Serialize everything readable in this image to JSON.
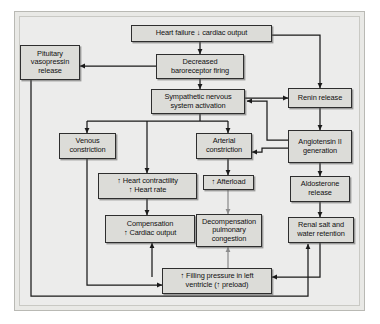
{
  "figure": {
    "background_color": "#ececeb",
    "node_fill_color": "#dcdcd8",
    "node_border_color": "#2e2e2e",
    "arrow_color": "#1a1a1a",
    "arrow_color_muted": "#8c8c8c"
  },
  "nodes": [
    {
      "id": "heart-failure",
      "label": "Heart failure ↓ cardiac output"
    },
    {
      "id": "pituitary",
      "label": "Pituitary\nvasopressin\nrelease"
    },
    {
      "id": "baroreceptor",
      "label": "Decreased\nbaroreceptor firing"
    },
    {
      "id": "sympathetic",
      "label": "Sympathetic nervous\nsystem activation"
    },
    {
      "id": "renin",
      "label": "Renin release"
    },
    {
      "id": "venous-constriction",
      "label": "Venous\nconstriction"
    },
    {
      "id": "arterial-constriction",
      "label": "Arterial\nconstriction"
    },
    {
      "id": "angiotensin",
      "label": "Angiotensin II\ngeneration"
    },
    {
      "id": "contractility",
      "label": "↑ Heart contractility\n↑ Heart rate"
    },
    {
      "id": "afterload",
      "label": "↑ Afterload"
    },
    {
      "id": "aldosterone",
      "label": "Aldosterone\nrelease"
    },
    {
      "id": "compensation",
      "label": "Compensation\n↑ Cardiac output"
    },
    {
      "id": "decompensation",
      "label": "Decompensation\npulmonary\ncongestion"
    },
    {
      "id": "renal-retention",
      "label": "Renal salt and\nwater retention"
    },
    {
      "id": "filling-pressure",
      "label": "↑ Filling pressure in left\nventricle (↑ preload)"
    }
  ],
  "edges": [
    {
      "from": "heart-failure",
      "to": "baroreceptor"
    },
    {
      "from": "heart-failure",
      "to": "renin"
    },
    {
      "from": "baroreceptor",
      "to": "pituitary"
    },
    {
      "from": "baroreceptor",
      "to": "sympathetic"
    },
    {
      "from": "sympathetic",
      "to": "renin"
    },
    {
      "from": "sympathetic",
      "to": "venous-constriction"
    },
    {
      "from": "sympathetic",
      "to": "contractility"
    },
    {
      "from": "sympathetic",
      "to": "arterial-constriction"
    },
    {
      "from": "renin",
      "to": "angiotensin"
    },
    {
      "from": "angiotensin",
      "to": "sympathetic"
    },
    {
      "from": "angiotensin",
      "to": "arterial-constriction"
    },
    {
      "from": "angiotensin",
      "to": "aldosterone"
    },
    {
      "from": "venous-constriction",
      "to": "filling-pressure"
    },
    {
      "from": "contractility",
      "to": "compensation"
    },
    {
      "from": "arterial-constriction",
      "to": "afterload"
    },
    {
      "from": "afterload",
      "to": "decompensation",
      "style": "muted"
    },
    {
      "from": "aldosterone",
      "to": "renal-retention"
    },
    {
      "from": "renal-retention",
      "to": "filling-pressure"
    },
    {
      "from": "filling-pressure",
      "to": "compensation"
    },
    {
      "from": "filling-pressure",
      "to": "decompensation",
      "style": "muted"
    },
    {
      "from": "pituitary",
      "to": "renal-retention"
    }
  ]
}
